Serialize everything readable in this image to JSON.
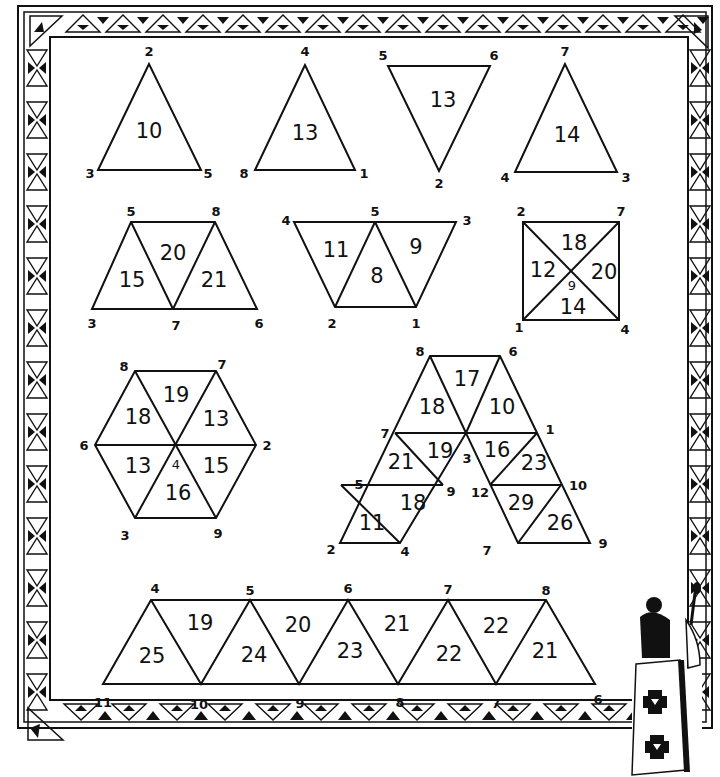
{
  "puzzle": {
    "type": "magic-triangle-number-puzzle",
    "background": "#ffffff",
    "ink": "#111111"
  },
  "shapes": {
    "triangle_a": {
      "top": "2",
      "left": "3",
      "right": "5",
      "sum": "10"
    },
    "triangle_b": {
      "top": "4",
      "left": "8",
      "right": "1",
      "sum": "13"
    },
    "triangle_c": {
      "top_left": "5",
      "top_right": "6",
      "bottom": "2",
      "sum": "13"
    },
    "triangle_d": {
      "top": "7",
      "left": "4",
      "right": "3",
      "sum": "14"
    },
    "trapezoid_a": {
      "top_left": "5",
      "top_right": "8",
      "bottom_left": "3",
      "bottom_mid": "7",
      "bottom_right": "6",
      "sums": [
        "15",
        "20",
        "21"
      ]
    },
    "trapezoid_b": {
      "top_left": "4",
      "top_mid": "5",
      "top_right": "3",
      "bottom_left": "2",
      "bottom_right": "1",
      "sums": [
        "11",
        "8",
        "9"
      ]
    },
    "square": {
      "top_left": "2",
      "top_right": "7",
      "bottom_left": "1",
      "bottom_right": "4",
      "center": "9",
      "sums": {
        "top": "18",
        "left": "12",
        "right": "20",
        "bottom": "14"
      }
    },
    "hexagon": {
      "top_left": "8",
      "top_right": "7",
      "right": "2",
      "bottom_right": "9",
      "bottom_left": "3",
      "left": "6",
      "center": "4",
      "sums": {
        "top": "19",
        "upper_right": "13",
        "lower_right": "15",
        "bottom": "16",
        "lower_left": "13",
        "upper_left": "18"
      }
    },
    "a_shape": {
      "vertices": {
        "top_left": "8",
        "top_right": "6",
        "mid_left": "7",
        "mid_center": "3",
        "mid_right": "1",
        "low_left": "5",
        "low_inner_left": "9",
        "low_inner_right": "12",
        "low_right": "10",
        "bottom_left": "2",
        "bottom_inner_left": "4",
        "bottom_inner_right": "7",
        "bottom_right": "9"
      },
      "sums": {
        "top_left": "18",
        "top_mid": "17",
        "top_right": "10",
        "left_upper_a": "21",
        "left_upper_b": "19",
        "right_upper_a": "16",
        "right_upper_b": "23",
        "left_lower_a": "11",
        "left_lower_b": "18",
        "right_lower_a": "29",
        "right_lower_b": "26"
      }
    },
    "strip": {
      "top": [
        "4",
        "5",
        "6",
        "7",
        "8"
      ],
      "bottom": [
        "11",
        "10",
        "9",
        "8",
        "7",
        "6"
      ],
      "sums_up": [
        "25",
        "24",
        "23",
        "22",
        "21"
      ],
      "sums_down": [
        "19",
        "20",
        "21",
        "22"
      ]
    }
  },
  "decoration": {
    "border": "triangle-pattern-frame",
    "figure": "painter-figure-icon"
  }
}
